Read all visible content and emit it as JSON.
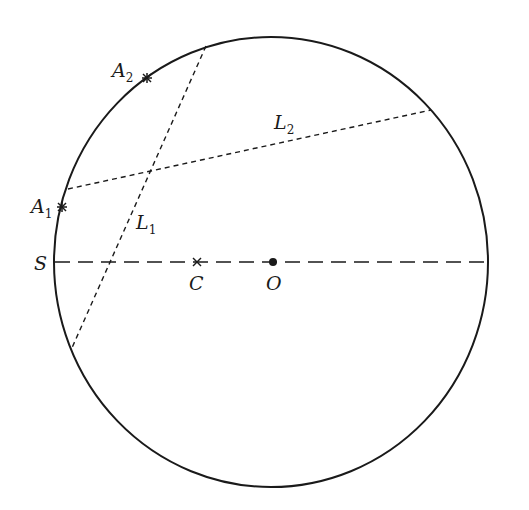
{
  "diagram": {
    "circle": {
      "cx": 271,
      "cy": 262,
      "rx": 217,
      "ry": 225
    },
    "diameter_line": {
      "x1": 55,
      "y1": 262,
      "x2": 488,
      "y2": 262,
      "style": "long-dash"
    },
    "chords": [
      {
        "name": "L1",
        "x1": 206,
        "y1": 46,
        "x2": 71,
        "y2": 350,
        "style": "short-dash"
      },
      {
        "name": "L2",
        "x1": 68,
        "y1": 189,
        "x2": 431,
        "y2": 110,
        "style": "short-dash"
      }
    ],
    "points": {
      "A1": {
        "x": 62,
        "y": 207,
        "marker": "cross"
      },
      "A2": {
        "x": 147,
        "y": 78,
        "marker": "cross"
      },
      "C": {
        "x": 197,
        "y": 262,
        "marker": "x"
      },
      "O": {
        "x": 273,
        "y": 262,
        "marker": "dot"
      }
    },
    "labels": {
      "A1": {
        "main": "A",
        "sub": "1"
      },
      "A2": {
        "main": "A",
        "sub": "2"
      },
      "L1": {
        "main": "L",
        "sub": "1"
      },
      "L2": {
        "main": "L",
        "sub": "2"
      },
      "S": "S",
      "C": "C",
      "O": "O"
    },
    "colors": {
      "stroke": "#1a1a1a",
      "background": "#ffffff"
    }
  }
}
